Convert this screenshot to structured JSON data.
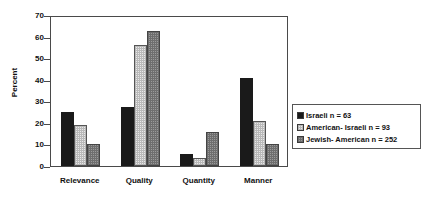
{
  "chart_data": {
    "type": "bar",
    "title": "",
    "xlabel": "",
    "ylabel": "Percent",
    "ylim": [
      0,
      70
    ],
    "yticks": [
      0,
      10,
      20,
      30,
      40,
      50,
      60,
      70
    ],
    "grid": false,
    "legend_position": "right",
    "categories": [
      "Relevance",
      "Quality",
      "Quantity",
      "Manner"
    ],
    "series": [
      {
        "name": "Israeli  n = 63",
        "label": "Israeli",
        "n": 63,
        "n_text": "n = 63",
        "color": "#1a1a1a",
        "pattern": "solid",
        "values": [
          25,
          27.5,
          5.5,
          41
        ]
      },
      {
        "name": "American- Israeli  n = 93",
        "label": "American- Israeli",
        "n": 93,
        "n_text": "n = 93",
        "color": "#e8e8e8",
        "pattern": "fine-checker-light",
        "values": [
          19,
          56,
          3.5,
          21
        ]
      },
      {
        "name": "Jewish- American  n = 252",
        "label": "Jewish- American",
        "n": 252,
        "n_text": "n = 252",
        "color": "#9a9a9a",
        "pattern": "fine-checker-gray",
        "values": [
          10.2,
          62.5,
          16,
          10
        ]
      }
    ]
  },
  "axis": {
    "y_title": "Percent",
    "tick_labels": [
      "70",
      "60",
      "50",
      "40",
      "30",
      "20",
      "10",
      "0"
    ]
  },
  "legend": {
    "entries": [
      {
        "text": "Israeli  n = 63",
        "swatch": "legend-swatch-israeli"
      },
      {
        "text": "American- Israeli  n = 93",
        "swatch": "legend-swatch-american-israeli"
      },
      {
        "text": "Jewish- American  n = 252",
        "swatch": "legend-swatch-jewish-american"
      }
    ]
  }
}
